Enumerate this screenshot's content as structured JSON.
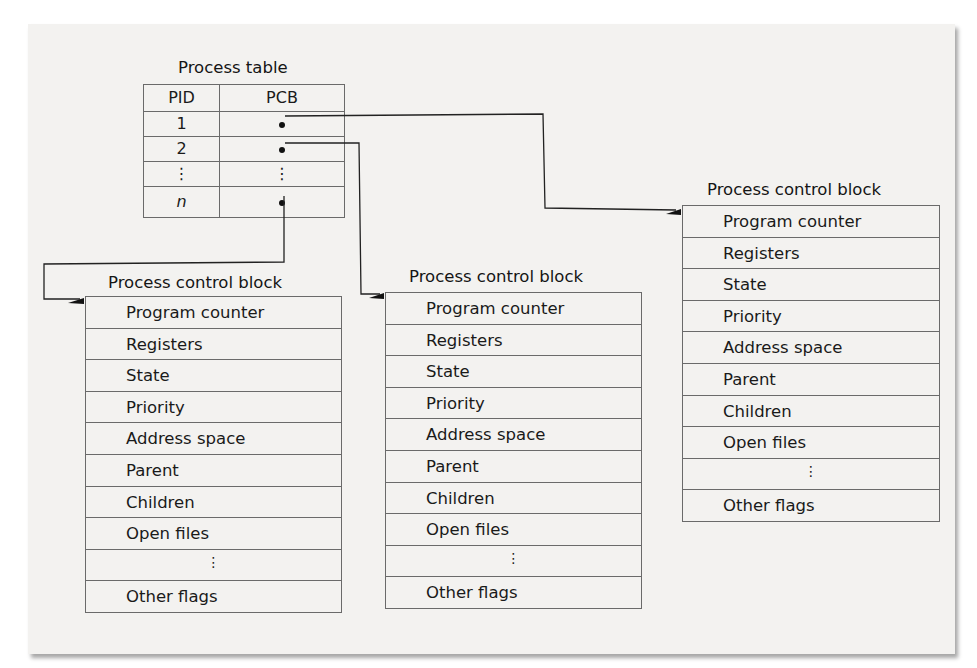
{
  "process_table": {
    "title": "Process table",
    "headers": [
      "PID",
      "PCB"
    ],
    "rows": [
      {
        "pid": "1",
        "pcb": "pointer"
      },
      {
        "pid": "2",
        "pcb": "pointer"
      },
      {
        "pid": "⋮",
        "pcb": "⋮"
      },
      {
        "pid": "n",
        "pcb": "pointer"
      }
    ]
  },
  "pcb_blocks": [
    {
      "title": "Process control block",
      "fields": [
        "Program counter",
        "Registers",
        "State",
        "Priority",
        "Address space",
        "Parent",
        "Children",
        "Open files",
        "⋮",
        "Other flags"
      ]
    },
    {
      "title": "Process control block",
      "fields": [
        "Program counter",
        "Registers",
        "State",
        "Priority",
        "Address space",
        "Parent",
        "Children",
        "Open files",
        "⋮",
        "Other flags"
      ]
    },
    {
      "title": "Process control block",
      "fields": [
        "Program counter",
        "Registers",
        "State",
        "Priority",
        "Address space",
        "Parent",
        "Children",
        "Open files",
        "⋮",
        "Other flags"
      ]
    }
  ],
  "connections": [
    {
      "from": "PID 1",
      "to": "right PCB"
    },
    {
      "from": "PID 2",
      "to": "middle PCB"
    },
    {
      "from": "PID n",
      "to": "left PCB"
    }
  ],
  "colors": {
    "paper": "#f3f2f0",
    "line": "#6a6a6a",
    "ink": "#1a1a1a"
  }
}
